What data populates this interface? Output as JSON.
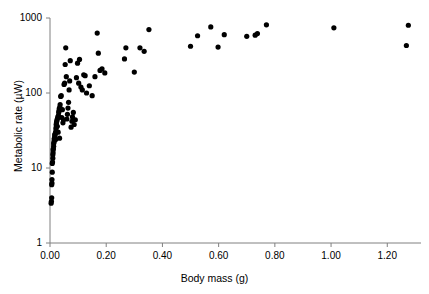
{
  "chart_data": {
    "type": "scatter",
    "title": "",
    "xlabel": "Body mass (g)",
    "ylabel": "Metabolic rate (µW)",
    "xlim": [
      0.0,
      1.32
    ],
    "ylim": [
      1,
      1000
    ],
    "yscale": "log",
    "xscale": "linear",
    "grid": false,
    "legend": null,
    "xticks": [
      "0.00",
      "0.20",
      "0.40",
      "0.60",
      "0.80",
      "1.00",
      "1.20"
    ],
    "xtick_values": [
      0.0,
      0.2,
      0.4,
      0.6,
      0.8,
      1.0,
      1.2
    ],
    "yticks": [
      "1",
      "10",
      "100",
      "1000"
    ],
    "ytick_values": [
      1,
      10,
      100,
      1000
    ],
    "marker": "filled-circle",
    "marker_color": "#000000",
    "axis_color": "#808080",
    "points": [
      [
        0.004,
        3.4
      ],
      [
        0.005,
        3.6
      ],
      [
        0.006,
        4.0
      ],
      [
        0.006,
        6.0
      ],
      [
        0.007,
        6.3
      ],
      [
        0.007,
        7.0
      ],
      [
        0.008,
        8.8
      ],
      [
        0.008,
        11.5
      ],
      [
        0.009,
        12.0
      ],
      [
        0.01,
        13.5
      ],
      [
        0.01,
        15.0
      ],
      [
        0.011,
        16.0
      ],
      [
        0.011,
        17.5
      ],
      [
        0.012,
        18.0
      ],
      [
        0.013,
        19.5
      ],
      [
        0.013,
        21.0
      ],
      [
        0.014,
        22.0
      ],
      [
        0.015,
        23.0
      ],
      [
        0.015,
        24.5
      ],
      [
        0.016,
        25.0
      ],
      [
        0.017,
        26.0
      ],
      [
        0.017,
        27.5
      ],
      [
        0.018,
        28.0
      ],
      [
        0.019,
        29.0
      ],
      [
        0.02,
        30.0
      ],
      [
        0.02,
        24.0
      ],
      [
        0.021,
        33.0
      ],
      [
        0.022,
        35.0
      ],
      [
        0.022,
        38.0
      ],
      [
        0.023,
        40.0
      ],
      [
        0.024,
        42.0
      ],
      [
        0.025,
        44.0
      ],
      [
        0.026,
        36.0
      ],
      [
        0.027,
        46.0
      ],
      [
        0.028,
        48.0
      ],
      [
        0.029,
        30.0
      ],
      [
        0.03,
        50.0
      ],
      [
        0.031,
        55.0
      ],
      [
        0.032,
        58.0
      ],
      [
        0.033,
        62.0
      ],
      [
        0.034,
        25.0
      ],
      [
        0.035,
        65.0
      ],
      [
        0.036,
        70.0
      ],
      [
        0.038,
        90.0
      ],
      [
        0.04,
        92.0
      ],
      [
        0.042,
        47.0
      ],
      [
        0.044,
        60.0
      ],
      [
        0.046,
        40.0
      ],
      [
        0.048,
        44.0
      ],
      [
        0.05,
        130.0
      ],
      [
        0.052,
        135.0
      ],
      [
        0.054,
        240.0
      ],
      [
        0.056,
        400.0
      ],
      [
        0.058,
        165.0
      ],
      [
        0.06,
        45.0
      ],
      [
        0.062,
        52.0
      ],
      [
        0.064,
        63.0
      ],
      [
        0.066,
        75.0
      ],
      [
        0.068,
        110.0
      ],
      [
        0.07,
        145.0
      ],
      [
        0.072,
        270.0
      ],
      [
        0.075,
        35.0
      ],
      [
        0.078,
        42.0
      ],
      [
        0.08,
        48.0
      ],
      [
        0.083,
        55.0
      ],
      [
        0.086,
        38.0
      ],
      [
        0.09,
        44.0
      ],
      [
        0.094,
        160.0
      ],
      [
        0.098,
        250.0
      ],
      [
        0.102,
        135.0
      ],
      [
        0.105,
        280.0
      ],
      [
        0.11,
        120.0
      ],
      [
        0.115,
        110.0
      ],
      [
        0.12,
        175.0
      ],
      [
        0.125,
        170.0
      ],
      [
        0.13,
        100.0
      ],
      [
        0.14,
        125.0
      ],
      [
        0.15,
        92.0
      ],
      [
        0.16,
        165.0
      ],
      [
        0.168,
        630.0
      ],
      [
        0.172,
        340.0
      ],
      [
        0.178,
        200.0
      ],
      [
        0.185,
        210.0
      ],
      [
        0.195,
        185.0
      ],
      [
        0.265,
        285.0
      ],
      [
        0.27,
        400.0
      ],
      [
        0.3,
        190.0
      ],
      [
        0.32,
        400.0
      ],
      [
        0.335,
        360.0
      ],
      [
        0.352,
        700.0
      ],
      [
        0.5,
        420.0
      ],
      [
        0.525,
        580.0
      ],
      [
        0.572,
        760.0
      ],
      [
        0.598,
        410.0
      ],
      [
        0.62,
        600.0
      ],
      [
        0.7,
        570.0
      ],
      [
        0.73,
        590.0
      ],
      [
        0.738,
        620.0
      ],
      [
        0.77,
        810.0
      ],
      [
        1.01,
        740.0
      ],
      [
        1.268,
        430.0
      ],
      [
        1.275,
        800.0
      ]
    ]
  }
}
